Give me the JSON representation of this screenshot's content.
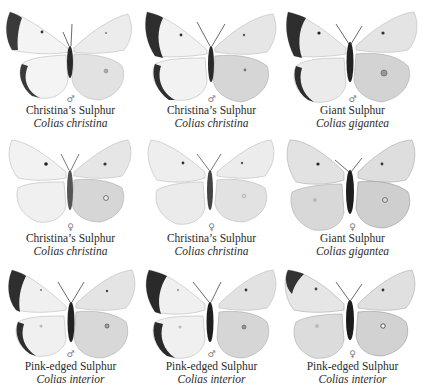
{
  "plate": {
    "rows": 3,
    "columns": 3,
    "specimens": [
      {
        "common_name": "Christina’s Sulphur",
        "scientific_name": "Colias christina",
        "sex": "♂",
        "sex_label": "male",
        "variant": "pale-bordered"
      },
      {
        "common_name": "Christina’s Sulphur",
        "scientific_name": "Colias christina",
        "sex": "♂",
        "sex_label": "male",
        "variant": "dark-bordered"
      },
      {
        "common_name": "Giant Sulphur",
        "scientific_name": "Colias gigantea",
        "sex": "♂",
        "sex_label": "male",
        "variant": "dark-bordered"
      },
      {
        "common_name": "Christina’s Sulphur",
        "scientific_name": "Colias christina",
        "sex": "♀",
        "sex_label": "female",
        "variant": "plain"
      },
      {
        "common_name": "Christina’s Sulphur",
        "scientific_name": "Colias christina",
        "sex": "♀",
        "sex_label": "female",
        "variant": "plain"
      },
      {
        "common_name": "Giant Sulphur",
        "scientific_name": "Colias gigantea",
        "sex": "♀",
        "sex_label": "female",
        "variant": "plain-dusky"
      },
      {
        "common_name": "Pink-edged Sulphur",
        "scientific_name": "Colias interior",
        "sex": "♂",
        "sex_label": "male",
        "variant": "dark-bordered"
      },
      {
        "common_name": "Pink-edged Sulphur",
        "scientific_name": "Colias interior",
        "sex": "♂",
        "sex_label": "male",
        "variant": "dark-bordered"
      },
      {
        "common_name": "Pink-edged Sulphur",
        "scientific_name": "Colias interior",
        "sex": "♀",
        "sex_label": "female",
        "variant": "tip-dusky"
      }
    ]
  },
  "colors": {
    "background": "#ffffff",
    "wing_light": "#f1f1f1",
    "wing_shade": "#d9d9d9",
    "wing_under": "#cfcfcf",
    "border_dark": "#2e2e2e",
    "body": "#242424",
    "text": "#2b2b2b"
  }
}
